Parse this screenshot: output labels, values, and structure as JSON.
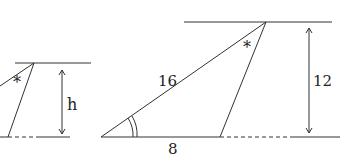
{
  "diagram": {
    "left_figure": {
      "height_label": "h",
      "angle_marker": "*"
    },
    "right_figure": {
      "side_label": "16",
      "base_label": "8",
      "height_label": "12",
      "angle_marker": "*"
    },
    "colors": {
      "line": "#333333",
      "background": "#ffffff"
    }
  }
}
